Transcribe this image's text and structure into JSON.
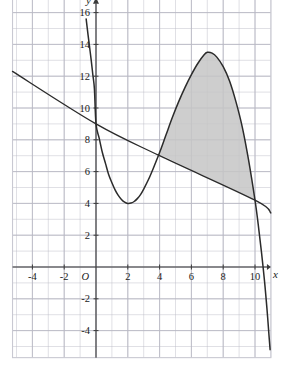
{
  "figure": {
    "background_color": "#ffffff",
    "grid_color": "#b9b9c4",
    "grid_border_color": "#c9c9d2",
    "axis_color": "#3a3a3a",
    "curve_color": "#2b2b2b",
    "line_color": "#2b2b2b",
    "shade_color": "#c6c6c6",
    "label_color": "#1a1a1a"
  },
  "chart_data": {
    "type": "line",
    "title": "",
    "subtitle": "",
    "xlabel": "x",
    "ylabel": "y",
    "origin_label": "O",
    "grid": true,
    "legend": "none",
    "xlim": [
      -5.25,
      11.0
    ],
    "ylim": [
      -5.7,
      16.9
    ],
    "xticks": [
      -4,
      -2,
      2,
      4,
      6,
      8,
      10
    ],
    "xtick_labels": [
      "-4",
      "-2",
      "2",
      "4",
      "6",
      "8",
      "10"
    ],
    "yticks": [
      -4,
      -2,
      2,
      4,
      6,
      8,
      10,
      12,
      14,
      16
    ],
    "ytick_labels": [
      "-4",
      "-2",
      "2",
      "4",
      "6",
      "8",
      "10",
      "12",
      "14",
      "16"
    ],
    "x_major_step": 2,
    "y_major_step": 2,
    "grid_minor_step": 1,
    "annotations": [
      {
        "text": "O",
        "x": 0,
        "y": 0,
        "role": "origin-label"
      },
      {
        "text": "x",
        "x": 10.9,
        "y": -0.55,
        "role": "x-axis-label"
      },
      {
        "text": "y",
        "x": -0.55,
        "y": 16.6,
        "role": "y-axis-label"
      }
    ],
    "series": [
      {
        "name": "cubic-curve",
        "type": "line",
        "color": "#2b2b2b",
        "equation_note": "cubic with local min (2,4) and local max (7,13.5)",
        "key_points": [
          {
            "x": 0,
            "y": 9.0,
            "role": "y-intercept"
          },
          {
            "x": 2,
            "y": 4.0,
            "role": "local-minimum"
          },
          {
            "x": 7,
            "y": 13.5,
            "role": "local-maximum"
          },
          {
            "x": 10,
            "y": 4.2,
            "role": "intersection-with-line"
          }
        ],
        "points": [
          {
            "x": -0.62,
            "y": 15.6
          },
          {
            "x": -0.5,
            "y": 14.6
          },
          {
            "x": -0.4,
            "y": 13.8
          },
          {
            "x": -0.3,
            "y": 13.0
          },
          {
            "x": -0.2,
            "y": 12.1
          },
          {
            "x": -0.1,
            "y": 11.2
          },
          {
            "x": 0.0,
            "y": 9.0
          },
          {
            "x": 0.2,
            "y": 8.1
          },
          {
            "x": 0.4,
            "y": 7.2
          },
          {
            "x": 0.6,
            "y": 6.5
          },
          {
            "x": 0.8,
            "y": 5.8
          },
          {
            "x": 1.0,
            "y": 5.3
          },
          {
            "x": 1.2,
            "y": 4.85
          },
          {
            "x": 1.4,
            "y": 4.5
          },
          {
            "x": 1.6,
            "y": 4.25
          },
          {
            "x": 1.8,
            "y": 4.08
          },
          {
            "x": 2.0,
            "y": 4.0
          },
          {
            "x": 2.2,
            "y": 4.02
          },
          {
            "x": 2.4,
            "y": 4.12
          },
          {
            "x": 2.6,
            "y": 4.3
          },
          {
            "x": 2.8,
            "y": 4.55
          },
          {
            "x": 3.0,
            "y": 4.9
          },
          {
            "x": 3.3,
            "y": 5.5
          },
          {
            "x": 3.6,
            "y": 6.2
          },
          {
            "x": 4.0,
            "y": 7.2
          },
          {
            "x": 4.4,
            "y": 8.3
          },
          {
            "x": 4.8,
            "y": 9.4
          },
          {
            "x": 5.2,
            "y": 10.4
          },
          {
            "x": 5.6,
            "y": 11.3
          },
          {
            "x": 6.0,
            "y": 12.1
          },
          {
            "x": 6.4,
            "y": 12.8
          },
          {
            "x": 6.8,
            "y": 13.35
          },
          {
            "x": 7.0,
            "y": 13.5
          },
          {
            "x": 7.3,
            "y": 13.45
          },
          {
            "x": 7.6,
            "y": 13.2
          },
          {
            "x": 8.0,
            "y": 12.6
          },
          {
            "x": 8.4,
            "y": 11.7
          },
          {
            "x": 8.8,
            "y": 10.4
          },
          {
            "x": 9.2,
            "y": 8.8
          },
          {
            "x": 9.6,
            "y": 6.7
          },
          {
            "x": 10.0,
            "y": 4.2
          },
          {
            "x": 10.2,
            "y": 2.7
          },
          {
            "x": 10.4,
            "y": 1.0
          },
          {
            "x": 10.6,
            "y": -0.9
          },
          {
            "x": 10.75,
            "y": -2.6
          },
          {
            "x": 10.88,
            "y": -4.3
          },
          {
            "x": 10.95,
            "y": -5.2
          }
        ]
      },
      {
        "name": "straight-line",
        "type": "line",
        "color": "#2b2b2b",
        "equation_note": "y = 9 - 0.52x approximately",
        "key_points": [
          {
            "x": 0,
            "y": 9.0,
            "role": "y-intercept"
          },
          {
            "x": 4,
            "y": 7.0,
            "role": "intersection-with-curve"
          },
          {
            "x": 10,
            "y": 4.2,
            "role": "intersection-with-curve"
          }
        ],
        "points": [
          {
            "x": -5.25,
            "y": 12.3
          },
          {
            "x": 0,
            "y": 9.0
          },
          {
            "x": 4,
            "y": 7.0
          },
          {
            "x": 10,
            "y": 4.2
          },
          {
            "x": 11.0,
            "y": 3.4
          }
        ]
      }
    ],
    "shaded_region": {
      "name": "area-between-curve-and-line",
      "fill_color": "#c6c6c6",
      "x_start": 4,
      "x_end": 10,
      "upper_boundary": "cubic-curve",
      "lower_boundary": "straight-line"
    }
  }
}
